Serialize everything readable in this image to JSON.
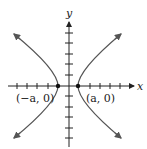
{
  "diagram": {
    "type": "hyperbola-graph",
    "axes": {
      "x_label": "x",
      "y_label": "y"
    },
    "vertices": [
      {
        "label": "(−a, 0)",
        "x": "-a",
        "y": 0
      },
      {
        "label": "(a, 0)",
        "x": "a",
        "y": 0
      }
    ],
    "colors": {
      "axis": "#222222",
      "curve": "#555555",
      "background": "#ffffff"
    }
  }
}
